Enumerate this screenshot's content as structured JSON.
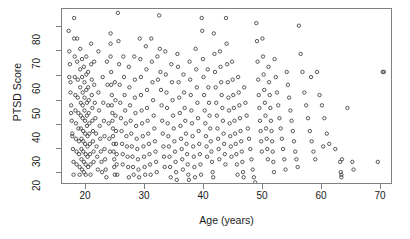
{
  "chart_data": {
    "type": "scatter",
    "title": "",
    "xlabel": "Age (years)",
    "ylabel": "PTSD Score",
    "xlim": [
      17.0,
      71.5
    ],
    "ylim": [
      16.0,
      84.5
    ],
    "xticks": [
      20,
      30,
      40,
      50,
      60,
      70
    ],
    "yticks": [
      20,
      30,
      40,
      50,
      60,
      70,
      80
    ],
    "xtick_labels": [
      "20",
      "30",
      "40",
      "50",
      "60",
      "70"
    ],
    "ytick_labels": [
      "20",
      "30",
      "40",
      "50",
      "60",
      "70",
      "80"
    ],
    "grid": false,
    "legend": null,
    "marker": "open-circle",
    "marker_size_px": 3.4,
    "marker_color": "#3c3c3c",
    "frame_color": "#808080",
    "background": "#ffffff",
    "n_points": 640,
    "series": [
      {
        "name": "participants",
        "x": [
          18.1,
          18.2,
          18.3,
          18.4,
          18.4,
          18.5,
          18.6,
          18.7,
          18.8,
          18.9,
          18.2,
          18.5,
          18.7,
          18.9,
          19.0,
          19.0,
          19.1,
          19.1,
          19.2,
          19.2,
          19.3,
          19.3,
          19.4,
          19.4,
          19.5,
          19.5,
          19.6,
          19.6,
          19.7,
          19.7,
          19.8,
          19.8,
          19.9,
          19.9,
          20.0,
          20.0,
          20.0,
          20.1,
          20.1,
          20.1,
          20.2,
          20.2,
          20.2,
          20.3,
          20.3,
          20.3,
          20.4,
          20.4,
          20.4,
          20.5,
          20.5,
          20.5,
          20.6,
          20.6,
          20.6,
          20.7,
          20.7,
          20.7,
          20.8,
          20.8,
          20.8,
          20.9,
          20.9,
          20.9,
          21.0,
          21.0,
          21.0,
          21.1,
          21.1,
          21.1,
          21.2,
          21.2,
          21.2,
          21.3,
          21.3,
          21.3,
          21.4,
          21.4,
          21.5,
          21.5,
          21.6,
          21.6,
          21.7,
          21.7,
          21.8,
          21.8,
          21.9,
          21.9,
          22.0,
          22.0,
          22.1,
          22.1,
          22.2,
          22.2,
          22.3,
          22.3,
          22.4,
          22.5,
          22.6,
          22.7,
          22.8,
          22.9,
          23.0,
          23.0,
          23.1,
          23.2,
          23.3,
          23.4,
          23.5,
          23.6,
          23.7,
          23.8,
          23.9,
          24.0,
          24.0,
          24.1,
          24.2,
          24.3,
          24.4,
          24.5,
          24.6,
          24.7,
          24.8,
          24.9,
          25.0,
          25.0,
          25.0,
          25.1,
          25.1,
          25.2,
          25.2,
          25.3,
          25.3,
          25.4,
          25.4,
          25.5,
          25.5,
          25.6,
          25.6,
          25.7,
          25.7,
          25.8,
          25.8,
          25.9,
          25.9,
          26.0,
          26.0,
          26.1,
          26.2,
          26.3,
          26.4,
          26.5,
          26.6,
          26.7,
          26.8,
          26.9,
          27.0,
          27.0,
          27.1,
          27.2,
          27.3,
          27.4,
          27.5,
          27.6,
          27.7,
          27.8,
          27.9,
          28.0,
          28.0,
          28.1,
          28.2,
          28.3,
          28.4,
          28.5,
          28.6,
          28.7,
          28.8,
          28.9,
          29.0,
          29.0,
          29.1,
          29.2,
          29.3,
          29.4,
          29.5,
          29.6,
          29.7,
          29.8,
          29.9,
          30.0,
          30.0,
          30.1,
          30.2,
          30.3,
          30.4,
          30.5,
          30.6,
          30.7,
          30.8,
          30.9,
          31.0,
          31.0,
          31.1,
          31.2,
          31.3,
          31.4,
          31.5,
          31.6,
          31.7,
          31.8,
          31.9,
          32.0,
          32.1,
          32.2,
          32.3,
          32.4,
          32.5,
          32.6,
          32.7,
          32.8,
          33.0,
          33.1,
          33.2,
          33.3,
          33.4,
          33.5,
          33.6,
          33.7,
          33.8,
          33.9,
          34.0,
          34.1,
          34.2,
          34.3,
          34.4,
          34.5,
          34.6,
          34.7,
          34.8,
          34.9,
          35.0,
          35.1,
          35.2,
          35.3,
          35.4,
          35.5,
          35.6,
          35.7,
          35.8,
          35.9,
          36.0,
          36.1,
          36.2,
          36.3,
          36.4,
          36.5,
          36.6,
          36.7,
          36.8,
          36.9,
          37.0,
          37.1,
          37.2,
          37.3,
          37.4,
          37.5,
          37.6,
          37.7,
          37.8,
          37.9,
          38.0,
          38.1,
          38.2,
          38.3,
          38.4,
          38.5,
          38.6,
          38.7,
          38.8,
          38.9,
          39.0,
          39.1,
          39.2,
          39.3,
          39.4,
          39.5,
          39.6,
          39.7,
          39.8,
          39.9,
          40.0,
          40.1,
          40.2,
          40.3,
          40.4,
          40.5,
          40.6,
          40.7,
          40.8,
          40.9,
          41.0,
          41.1,
          41.2,
          41.3,
          41.4,
          41.5,
          41.6,
          41.7,
          41.8,
          41.9,
          42.0,
          42.1,
          42.2,
          42.3,
          42.4,
          42.5,
          42.6,
          42.7,
          42.8,
          42.9,
          43.0,
          43.1,
          43.2,
          43.3,
          43.4,
          43.5,
          43.6,
          43.7,
          43.8,
          43.9,
          44.0,
          44.1,
          44.2,
          44.3,
          44.4,
          44.5,
          44.6,
          44.7,
          44.8,
          44.9,
          45.0,
          45.1,
          45.2,
          45.3,
          45.4,
          45.5,
          45.6,
          45.7,
          45.8,
          45.9,
          46.0,
          46.1,
          46.2,
          46.3,
          46.4,
          46.5,
          46.6,
          46.7,
          46.8,
          46.9,
          47.0,
          47.2,
          47.4,
          47.6,
          47.8,
          48.0,
          48.2,
          48.4,
          48.6,
          48.8,
          49.0,
          49.1,
          49.2,
          49.3,
          49.4,
          49.5,
          49.6,
          49.7,
          49.8,
          49.9,
          50.0,
          50.1,
          50.2,
          50.3,
          50.4,
          50.5,
          50.6,
          50.7,
          50.8,
          50.9,
          51.0,
          51.1,
          51.2,
          51.3,
          51.4,
          51.5,
          51.6,
          51.7,
          51.8,
          51.9,
          52.0,
          52.2,
          52.4,
          52.6,
          52.8,
          53.0,
          53.2,
          53.4,
          53.6,
          53.8,
          54.0,
          54.2,
          54.4,
          54.6,
          54.8,
          55.0,
          55.2,
          55.4,
          55.6,
          55.8,
          56.0,
          56.3,
          56.6,
          56.9,
          57.2,
          57.5,
          57.8,
          58.1,
          58.4,
          58.7,
          59.0,
          59.4,
          59.8,
          60.2,
          60.6,
          61.0,
          62.0,
          62.8,
          62.9,
          63.0,
          63.0,
          63.1,
          64.0,
          64.8,
          65.0,
          69.0,
          69.8,
          70.0,
          58.0,
          60.0
        ],
        "y": [
          76,
          68,
          63,
          56,
          52,
          47,
          41,
          36,
          30,
          20,
          58,
          44,
          35,
          25,
          81,
          73,
          66,
          58,
          51,
          45,
          40,
          34,
          29,
          24,
          73,
          64,
          57,
          50,
          44,
          38,
          33,
          28,
          23,
          20,
          69,
          61,
          54,
          48,
          43,
          38,
          34,
          30,
          26,
          22,
          65,
          58,
          52,
          47,
          42,
          37,
          33,
          29,
          25,
          21,
          62,
          56,
          50,
          45,
          41,
          36,
          32,
          28,
          24,
          20,
          66,
          59,
          53,
          48,
          43,
          39,
          35,
          31,
          27,
          23,
          60,
          54,
          49,
          44,
          40,
          36,
          32,
          28,
          24,
          20,
          71,
          63,
          57,
          51,
          46,
          41,
          37,
          33,
          29,
          25,
          64,
          55,
          48,
          42,
          36,
          31,
          27,
          22,
          68,
          52,
          45,
          39,
          34,
          29,
          25,
          21,
          58,
          48,
          41,
          35,
          30,
          26,
          22,
          19,
          64,
          55,
          47,
          40,
          34,
          29,
          75,
          71,
          66,
          60,
          55,
          51,
          47,
          44,
          41,
          38,
          35,
          32,
          29,
          26,
          23,
          20,
          56,
          49,
          43,
          37,
          32,
          28,
          24,
          20,
          83,
          72,
          63,
          55,
          48,
          42,
          37,
          32,
          28,
          24,
          66,
          58,
          51,
          45,
          40,
          35,
          31,
          27,
          23,
          19,
          62,
          54,
          47,
          41,
          36,
          31,
          27,
          23,
          20,
          66,
          57,
          50,
          44,
          39,
          34,
          30,
          26,
          22,
          19,
          73,
          65,
          58,
          51,
          45,
          40,
          35,
          31,
          27,
          23,
          20,
          70,
          61,
          53,
          46,
          41,
          36,
          32,
          28,
          24,
          20,
          73,
          64,
          56,
          49,
          43,
          38,
          33,
          29,
          25,
          21,
          66,
          57,
          82,
          69,
          60,
          53,
          47,
          41,
          36,
          31,
          27,
          23,
          68,
          59,
          52,
          46,
          40,
          35,
          31,
          27,
          23,
          19,
          63,
          56,
          49,
          43,
          38,
          33,
          29,
          25,
          21,
          18,
          67,
          62,
          56,
          50,
          44,
          39,
          34,
          30,
          26,
          22,
          59,
          52,
          46,
          41,
          36,
          32,
          28,
          24,
          20,
          18,
          64,
          57,
          51,
          45,
          40,
          35,
          31,
          27,
          23,
          19,
          69,
          61,
          54,
          48,
          42,
          37,
          32,
          28,
          24,
          20,
          81,
          76,
          65,
          58,
          51,
          45,
          40,
          35,
          31,
          27,
          61,
          54,
          48,
          43,
          38,
          33,
          29,
          25,
          21,
          19,
          75,
          67,
          60,
          54,
          48,
          43,
          38,
          34,
          30,
          26,
          68,
          62,
          56,
          51,
          46,
          41,
          36,
          32,
          28,
          24,
          81,
          71,
          63,
          56,
          50,
          45,
          40,
          35,
          31,
          27,
          64,
          57,
          51,
          46,
          41,
          36,
          32,
          28,
          24,
          20,
          58,
          52,
          47,
          42,
          37,
          33,
          29,
          25,
          21,
          19,
          54,
          48,
          43,
          38,
          34,
          30,
          26,
          22,
          19,
          17,
          79,
          72,
          64,
          57,
          51,
          46,
          41,
          37,
          33,
          29,
          73,
          66,
          59,
          53,
          48,
          43,
          38,
          34,
          30,
          26,
          62,
          56,
          51,
          46,
          41,
          37,
          33,
          29,
          25,
          21,
          65,
          58,
          52,
          47,
          42,
          38,
          34,
          30,
          26,
          22,
          60,
          55,
          50,
          45,
          41,
          37,
          33,
          29,
          26,
          23,
          78,
          67,
          60,
          52,
          47,
          42,
          37,
          33,
          29,
          26,
          60,
          51,
          47,
          42,
          36,
          32,
          30,
          25,
          21,
          20,
          19,
          26,
          46,
          25,
          22,
          25,
          60,
          60,
          58,
          31
        ]
      }
    ]
  },
  "axes": {
    "frame": true,
    "tick_direction": "outside"
  }
}
